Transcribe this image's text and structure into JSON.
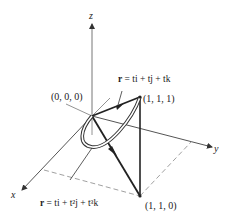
{
  "figure": {
    "axes": {
      "x_label": "x",
      "y_label": "y",
      "z_label": "z"
    },
    "points": {
      "origin": "(0, 0, 0)",
      "p111": "(1, 1, 1)",
      "p110": "(1, 1, 0)"
    },
    "curves": {
      "line": {
        "r": "r",
        "eq": " = ti + tj + tk"
      },
      "cubic": {
        "r": "r",
        "eq": " = ti + t²j + t³k"
      }
    },
    "colors": {
      "ink": "#222222",
      "axis": "#555555"
    }
  }
}
